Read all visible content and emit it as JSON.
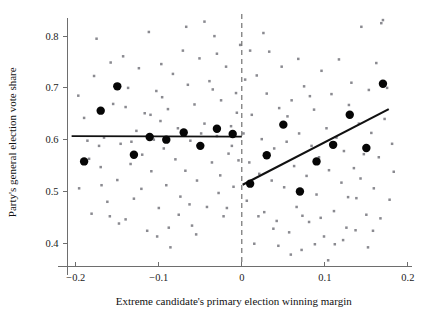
{
  "figure": {
    "name": "regression-discontinuity-scatter",
    "background_color": "#ffffff",
    "point_color": "#8a8a90",
    "bin_color": "#060606",
    "line_color": "#111111",
    "axis_color": "#6e6e6e",
    "cutoff_color": "#555555"
  },
  "chart_data": {
    "type": "scatter",
    "title": "",
    "subtitle": "",
    "xlabel": "Extreme candidate's primary election winning margin",
    "ylabel": "Party's general election vote share",
    "xlim": [
      -0.21,
      0.205
    ],
    "ylim": [
      0.355,
      0.835
    ],
    "xticks": [
      -0.2,
      -0.1,
      0,
      0.1,
      0.2
    ],
    "xtick_labels": [
      "−0.2",
      "−0.1",
      "0",
      "0.1",
      "0.2"
    ],
    "yticks": [
      0.4,
      0.5,
      0.6,
      0.7,
      0.8
    ],
    "ytick_labels": [
      "0.4",
      "0.5",
      "0.6",
      "0.7",
      "0.8"
    ],
    "grid": false,
    "legend": null,
    "cutoff": {
      "x": 0,
      "style": "dashed",
      "label": ""
    },
    "series": [
      {
        "name": "raw-observations",
        "type": "scatter",
        "marker": "small-dot",
        "color": "#8a8a90",
        "points": [
          [
            -0.197,
            0.685
          ],
          [
            -0.196,
            0.506
          ],
          [
            -0.19,
            0.642
          ],
          [
            -0.184,
            0.563
          ],
          [
            -0.181,
            0.457
          ],
          [
            -0.178,
            0.723
          ],
          [
            -0.175,
            0.795
          ],
          [
            -0.17,
            0.547
          ],
          [
            -0.166,
            0.604
          ],
          [
            -0.162,
            0.48
          ],
          [
            -0.158,
            0.749
          ],
          [
            -0.155,
            0.669
          ],
          [
            -0.15,
            0.522
          ],
          [
            -0.146,
            0.592
          ],
          [
            -0.143,
            0.761
          ],
          [
            -0.14,
            0.446
          ],
          [
            -0.137,
            0.7
          ],
          [
            -0.134,
            0.553
          ],
          [
            -0.13,
            0.486
          ],
          [
            -0.127,
            0.617
          ],
          [
            -0.124,
            0.738
          ],
          [
            -0.12,
            0.571
          ],
          [
            -0.117,
            0.651
          ],
          [
            -0.114,
            0.424
          ],
          [
            -0.112,
            0.808
          ],
          [
            -0.109,
            0.539
          ],
          [
            -0.106,
            0.6
          ],
          [
            -0.103,
            0.694
          ],
          [
            -0.1,
            0.468
          ],
          [
            -0.097,
            0.746
          ],
          [
            -0.094,
            0.583
          ],
          [
            -0.091,
            0.512
          ],
          [
            -0.089,
            0.659
          ],
          [
            -0.086,
            0.392
          ],
          [
            -0.083,
            0.727
          ],
          [
            -0.08,
            0.562
          ],
          [
            -0.077,
            0.622
          ],
          [
            -0.074,
            0.49
          ],
          [
            -0.071,
            0.772
          ],
          [
            -0.068,
            0.54
          ],
          [
            -0.065,
            0.706
          ],
          [
            -0.062,
            0.598
          ],
          [
            -0.06,
            0.434
          ],
          [
            -0.057,
            0.668
          ],
          [
            -0.054,
            0.521
          ],
          [
            -0.051,
            0.757
          ],
          [
            -0.048,
            0.586
          ],
          [
            -0.045,
            0.631
          ],
          [
            -0.042,
            0.47
          ],
          [
            -0.039,
            0.713
          ],
          [
            -0.036,
            0.556
          ],
          [
            -0.033,
            0.8
          ],
          [
            -0.03,
            0.607
          ],
          [
            -0.028,
            0.497
          ],
          [
            -0.025,
            0.676
          ],
          [
            -0.022,
            0.452
          ],
          [
            -0.019,
            0.741
          ],
          [
            -0.016,
            0.573
          ],
          [
            -0.013,
            0.626
          ],
          [
            -0.01,
            0.509
          ],
          [
            -0.007,
            0.69
          ],
          [
            -0.004,
            0.56
          ],
          [
            -0.002,
            0.783
          ],
          [
            -0.172,
            0.588
          ],
          [
            -0.148,
            0.438
          ],
          [
            -0.121,
            0.505
          ],
          [
            -0.098,
            0.636
          ],
          [
            -0.076,
            0.455
          ],
          [
            -0.049,
            0.612
          ],
          [
            -0.026,
            0.531
          ],
          [
            -0.012,
            0.588
          ],
          [
            -0.063,
            0.475
          ],
          [
            -0.088,
            0.43
          ],
          [
            -0.11,
            0.648
          ],
          [
            -0.133,
            0.596
          ],
          [
            -0.159,
            0.452
          ],
          [
            -0.186,
            0.598
          ],
          [
            -0.045,
            0.828
          ],
          [
            -0.03,
            0.766
          ],
          [
            -0.067,
            0.818
          ],
          [
            -0.096,
            0.682
          ],
          [
            -0.018,
            0.468
          ],
          [
            -0.055,
            0.417
          ],
          [
            -0.102,
            0.413
          ],
          [
            -0.14,
            0.663
          ],
          [
            -0.169,
            0.512
          ],
          [
            -0.006,
            0.652
          ],
          [
            -0.035,
            0.697
          ],
          [
            0.002,
            0.612
          ],
          [
            0.004,
            0.716
          ],
          [
            0.006,
            0.482
          ],
          [
            0.009,
            0.556
          ],
          [
            0.012,
            0.648
          ],
          [
            0.015,
            0.399
          ],
          [
            0.018,
            0.724
          ],
          [
            0.021,
            0.534
          ],
          [
            0.024,
            0.601
          ],
          [
            0.027,
            0.46
          ],
          [
            0.03,
            0.689
          ],
          [
            0.033,
            0.77
          ],
          [
            0.036,
            0.521
          ],
          [
            0.039,
            0.583
          ],
          [
            0.042,
            0.443
          ],
          [
            0.045,
            0.661
          ],
          [
            0.048,
            0.741
          ],
          [
            0.051,
            0.508
          ],
          [
            0.054,
            0.596
          ],
          [
            0.057,
            0.421
          ],
          [
            0.06,
            0.676
          ],
          [
            0.063,
            0.549
          ],
          [
            0.066,
            0.47
          ],
          [
            0.069,
            0.612
          ],
          [
            0.072,
            0.387
          ],
          [
            0.075,
            0.703
          ],
          [
            0.078,
            0.53
          ],
          [
            0.081,
            0.441
          ],
          [
            0.084,
            0.588
          ],
          [
            0.087,
            0.658
          ],
          [
            0.09,
            0.494
          ],
          [
            0.093,
            0.566
          ],
          [
            0.096,
            0.733
          ],
          [
            0.099,
            0.413
          ],
          [
            0.102,
            0.622
          ],
          [
            0.105,
            0.541
          ],
          [
            0.108,
            0.688
          ],
          [
            0.111,
            0.462
          ],
          [
            0.114,
            0.604
          ],
          [
            0.117,
            0.755
          ],
          [
            0.12,
            0.517
          ],
          [
            0.123,
            0.578
          ],
          [
            0.126,
            0.43
          ],
          [
            0.129,
            0.667
          ],
          [
            0.132,
            0.71
          ],
          [
            0.135,
            0.545
          ],
          [
            0.138,
            0.487
          ],
          [
            0.141,
            0.631
          ],
          [
            0.144,
            0.818
          ],
          [
            0.147,
            0.572
          ],
          [
            0.15,
            0.455
          ],
          [
            0.153,
            0.696
          ],
          [
            0.156,
            0.613
          ],
          [
            0.159,
            0.506
          ],
          [
            0.162,
            0.748
          ],
          [
            0.165,
            0.566
          ],
          [
            0.168,
            0.825
          ],
          [
            0.17,
            0.831
          ],
          [
            0.172,
            0.64
          ],
          [
            0.175,
            0.7
          ],
          [
            0.178,
            0.484
          ],
          [
            0.181,
            0.592
          ],
          [
            0.01,
            0.772
          ],
          [
            0.026,
            0.806
          ],
          [
            0.044,
            0.395
          ],
          [
            0.059,
            0.378
          ],
          [
            0.073,
            0.453
          ],
          [
            0.088,
            0.398
          ],
          [
            0.104,
            0.367
          ],
          [
            0.122,
            0.406
          ],
          [
            0.137,
            0.425
          ],
          [
            0.152,
            0.392
          ],
          [
            0.167,
            0.448
          ],
          [
            0.183,
            0.538
          ],
          [
            0.02,
            0.452
          ],
          [
            0.038,
            0.428
          ],
          [
            0.055,
            0.645
          ],
          [
            0.068,
            0.756
          ],
          [
            0.082,
            0.684
          ],
          [
            0.095,
            0.449
          ],
          [
            0.112,
            0.398
          ],
          [
            0.128,
            0.489
          ],
          [
            0.143,
            0.525
          ],
          [
            0.158,
            0.424
          ]
        ]
      },
      {
        "name": "binned-means",
        "type": "scatter",
        "marker": "large-dot",
        "color": "#060606",
        "points": [
          [
            -0.19,
            0.558
          ],
          [
            -0.17,
            0.656
          ],
          [
            -0.15,
            0.703
          ],
          [
            -0.13,
            0.571
          ],
          [
            -0.111,
            0.605
          ],
          [
            -0.091,
            0.6
          ],
          [
            -0.07,
            0.614
          ],
          [
            -0.05,
            0.588
          ],
          [
            -0.03,
            0.621
          ],
          [
            -0.011,
            0.611
          ],
          [
            0.01,
            0.515
          ],
          [
            0.03,
            0.57
          ],
          [
            0.05,
            0.629
          ],
          [
            0.07,
            0.5
          ],
          [
            0.09,
            0.558
          ],
          [
            0.11,
            0.59
          ],
          [
            0.13,
            0.648
          ],
          [
            0.15,
            0.584
          ],
          [
            0.17,
            0.708
          ]
        ]
      }
    ],
    "fits": [
      {
        "name": "left-fit-line",
        "side": "left",
        "x_start": -0.205,
        "y_start": 0.607,
        "x_end": 0.0,
        "y_end": 0.606
      },
      {
        "name": "right-fit-line",
        "side": "right",
        "x_start": 0.001,
        "y_start": 0.513,
        "x_end": 0.177,
        "y_end": 0.659
      }
    ]
  }
}
